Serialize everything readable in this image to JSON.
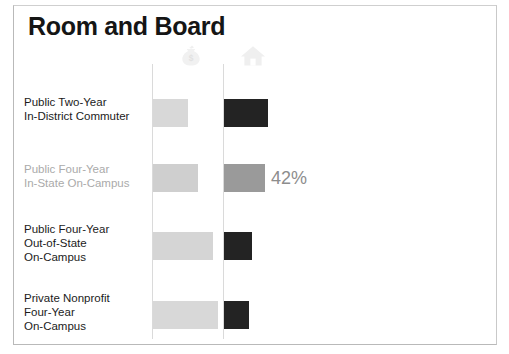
{
  "slide": {
    "title": "Room and Board",
    "background": "#ffffff",
    "frame_color": "#b9b9b9"
  },
  "columns": [
    {
      "icon": "money-bag-icon",
      "color": "#f0f0f0"
    },
    {
      "icon": "house-icon",
      "color": "#efefef"
    }
  ],
  "colors": {
    "bar_light": "#d8d8d8",
    "bar_dark": "#232323",
    "bar_gray": "#9a9a9a",
    "label": "#1b1b1b",
    "label_muted": "#aaaaaa",
    "axis": "#dadada",
    "pct_text": "#8d8d8d"
  },
  "chart_data": {
    "type": "bar",
    "title": "Room and Board",
    "orientation": "horizontal",
    "xlabel": "",
    "ylabel": "",
    "grid": false,
    "legend": "none",
    "categories": [
      "Public Two-Year\nIn-District Commuter",
      "Public Four-Year\nIn-State On-Campus",
      "Public Four-Year\nOut-of-State\nOn-Campus",
      "Private Nonprofit\nFour-Year\nOn-Campus"
    ],
    "series": [
      {
        "name": "money-bag-icon",
        "values": [
          35,
          45,
          60,
          65
        ]
      },
      {
        "name": "house-icon",
        "values": [
          44,
          41,
          28,
          25
        ]
      }
    ],
    "annotations": [
      {
        "row": 1,
        "series": "house-icon",
        "text": "42%"
      }
    ]
  },
  "rows": [
    {
      "label": "Public Two-Year\nIn-District Commuter",
      "muted": false,
      "bar_a": {
        "width": 35,
        "color": "#d8d8d8"
      },
      "bar_b": {
        "width": 44,
        "color": "#232323"
      },
      "pct": ""
    },
    {
      "label": "Public Four-Year\nIn-State On-Campus",
      "muted": true,
      "bar_a": {
        "width": 45,
        "color": "#cfcfcf"
      },
      "bar_b": {
        "width": 41,
        "color": "#9a9a9a"
      },
      "pct": "42%"
    },
    {
      "label": "Public Four-Year\nOut-of-State\nOn-Campus",
      "muted": false,
      "bar_a": {
        "width": 60,
        "color": "#d5d5d5"
      },
      "bar_b": {
        "width": 28,
        "color": "#232323"
      },
      "pct": ""
    },
    {
      "label": "Private Nonprofit\nFour-Year\nOn-Campus",
      "muted": false,
      "bar_a": {
        "width": 65,
        "color": "#d8d8d8"
      },
      "bar_b": {
        "width": 25,
        "color": "#232323"
      },
      "pct": ""
    }
  ]
}
